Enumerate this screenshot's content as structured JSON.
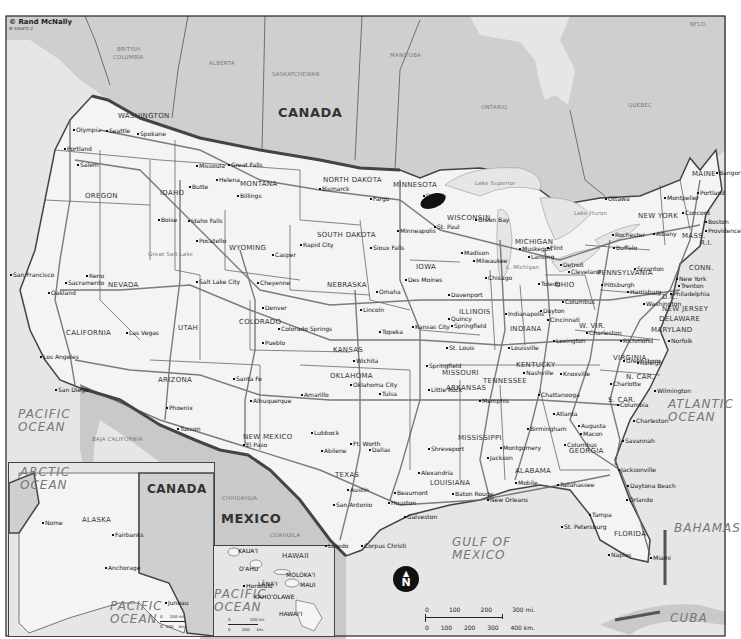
{
  "credit": {
    "publisher": "© Rand McNally",
    "code": "M-100672-2"
  },
  "countries": [
    {
      "name": "CANADA",
      "x": 278,
      "y": 106
    },
    {
      "name": "MEXICO",
      "x": 221,
      "y": 512
    },
    {
      "name": "CANADA",
      "x": 147,
      "y": 483,
      "inset": true
    }
  ],
  "provinces": [
    {
      "name": "BRITISH",
      "x": 117,
      "y": 47
    },
    {
      "name": "COLUMBIA",
      "x": 113,
      "y": 55
    },
    {
      "name": "ALBERTA",
      "x": 209,
      "y": 61
    },
    {
      "name": "SASKATCHEWAN",
      "x": 272,
      "y": 72
    },
    {
      "name": "MANITOBA",
      "x": 390,
      "y": 53
    },
    {
      "name": "ONTARIO",
      "x": 481,
      "y": 105
    },
    {
      "name": "QUÉBEC",
      "x": 628,
      "y": 103
    },
    {
      "name": "NFLD.",
      "x": 690,
      "y": 22
    },
    {
      "name": "CHIHUAHUA",
      "x": 222,
      "y": 496
    },
    {
      "name": "COAHUILA",
      "x": 270,
      "y": 533
    },
    {
      "name": "BAJA CALIFORNIA",
      "x": 92,
      "y": 437
    }
  ],
  "oceans": [
    {
      "name": "PACIFIC\nOCEAN",
      "x": 18,
      "y": 408
    },
    {
      "name": "ATLANTIC\nOCEAN",
      "x": 668,
      "y": 398
    },
    {
      "name": "GULF OF\nMEXICO",
      "x": 452,
      "y": 536
    },
    {
      "name": "BAHAMAS",
      "x": 674,
      "y": 522
    },
    {
      "name": "CUBA",
      "x": 670,
      "y": 612
    },
    {
      "name": "ARCTIC\nOCEAN",
      "x": 20,
      "y": 466
    },
    {
      "name": "PACIFIC\nOCEAN",
      "x": 110,
      "y": 600
    },
    {
      "name": "PACIFIC\nOCEAN",
      "x": 214,
      "y": 588
    }
  ],
  "states": [
    {
      "name": "WASHINGTON",
      "x": 118,
      "y": 113
    },
    {
      "name": "OREGON",
      "x": 85,
      "y": 193
    },
    {
      "name": "CALIFORNIA",
      "x": 66,
      "y": 330
    },
    {
      "name": "NEVADA",
      "x": 108,
      "y": 282
    },
    {
      "name": "IDAHO",
      "x": 160,
      "y": 190
    },
    {
      "name": "MONTANA",
      "x": 240,
      "y": 181
    },
    {
      "name": "WYOMING",
      "x": 229,
      "y": 245
    },
    {
      "name": "UTAH",
      "x": 178,
      "y": 325
    },
    {
      "name": "ARIZONA",
      "x": 158,
      "y": 377
    },
    {
      "name": "COLORADO",
      "x": 239,
      "y": 319
    },
    {
      "name": "NEW MEXICO",
      "x": 243,
      "y": 434
    },
    {
      "name": "NORTH DAKOTA",
      "x": 323,
      "y": 177
    },
    {
      "name": "SOUTH DAKOTA",
      "x": 317,
      "y": 232
    },
    {
      "name": "NEBRASKA",
      "x": 327,
      "y": 282
    },
    {
      "name": "KANSAS",
      "x": 333,
      "y": 347
    },
    {
      "name": "OKLAHOMA",
      "x": 330,
      "y": 373
    },
    {
      "name": "TEXAS",
      "x": 335,
      "y": 472
    },
    {
      "name": "MINNESOTA",
      "x": 393,
      "y": 182
    },
    {
      "name": "IOWA",
      "x": 416,
      "y": 264
    },
    {
      "name": "MISSOURI",
      "x": 442,
      "y": 370
    },
    {
      "name": "ARKANSAS",
      "x": 446,
      "y": 385
    },
    {
      "name": "LOUISIANA",
      "x": 430,
      "y": 480
    },
    {
      "name": "WISCONSIN",
      "x": 447,
      "y": 215
    },
    {
      "name": "ILLINOIS",
      "x": 459,
      "y": 309
    },
    {
      "name": "MICHIGAN",
      "x": 515,
      "y": 239
    },
    {
      "name": "INDIANA",
      "x": 510,
      "y": 326
    },
    {
      "name": "OHIO",
      "x": 555,
      "y": 282
    },
    {
      "name": "KENTUCKY",
      "x": 516,
      "y": 362
    },
    {
      "name": "TENNESSEE",
      "x": 483,
      "y": 378
    },
    {
      "name": "MISSISSIPPI",
      "x": 458,
      "y": 435
    },
    {
      "name": "ALABAMA",
      "x": 515,
      "y": 468
    },
    {
      "name": "GEORGIA",
      "x": 569,
      "y": 448
    },
    {
      "name": "FLORIDA",
      "x": 614,
      "y": 531
    },
    {
      "name": "S. CAR.",
      "x": 608,
      "y": 397
    },
    {
      "name": "N. CAR.",
      "x": 626,
      "y": 374
    },
    {
      "name": "VIRGINIA",
      "x": 613,
      "y": 355
    },
    {
      "name": "W. VIR.",
      "x": 579,
      "y": 323
    },
    {
      "name": "PENNSYLVANIA",
      "x": 597,
      "y": 270
    },
    {
      "name": "NEW YORK",
      "x": 638,
      "y": 213
    },
    {
      "name": "NEW JERSEY",
      "x": 662,
      "y": 306
    },
    {
      "name": "DELAWARE",
      "x": 659,
      "y": 316
    },
    {
      "name": "MARYLAND",
      "x": 651,
      "y": 327
    },
    {
      "name": "D.C.",
      "x": 662,
      "y": 294
    },
    {
      "name": "CONN.",
      "x": 689,
      "y": 265
    },
    {
      "name": "MASS.",
      "x": 682,
      "y": 233
    },
    {
      "name": "R.I.",
      "x": 700,
      "y": 240
    },
    {
      "name": "MAINE",
      "x": 692,
      "y": 171
    },
    {
      "name": "ALASKA",
      "x": 82,
      "y": 517
    },
    {
      "name": "HAWAII",
      "x": 282,
      "y": 553
    }
  ],
  "cities": [
    {
      "name": "Olympia",
      "x": 73,
      "y": 127
    },
    {
      "name": "Seattle",
      "x": 106,
      "y": 128
    },
    {
      "name": "Spokane",
      "x": 137,
      "y": 131
    },
    {
      "name": "Portland",
      "x": 64,
      "y": 146
    },
    {
      "name": "Salem",
      "x": 77,
      "y": 162
    },
    {
      "name": "Missoula",
      "x": 196,
      "y": 163
    },
    {
      "name": "Great Falls",
      "x": 228,
      "y": 162
    },
    {
      "name": "Helena",
      "x": 216,
      "y": 177
    },
    {
      "name": "Butte",
      "x": 189,
      "y": 184
    },
    {
      "name": "Billings",
      "x": 237,
      "y": 193
    },
    {
      "name": "Boise",
      "x": 158,
      "y": 217
    },
    {
      "name": "Idaho Falls",
      "x": 188,
      "y": 218
    },
    {
      "name": "Pocatello",
      "x": 196,
      "y": 238
    },
    {
      "name": "Bismarck",
      "x": 319,
      "y": 186
    },
    {
      "name": "Fargo",
      "x": 370,
      "y": 196
    },
    {
      "name": "Duluth",
      "x": 423,
      "y": 193
    },
    {
      "name": "Minneapolis",
      "x": 397,
      "y": 228
    },
    {
      "name": "St. Paul",
      "x": 434,
      "y": 224
    },
    {
      "name": "Rapid City",
      "x": 300,
      "y": 242
    },
    {
      "name": "Sioux Falls",
      "x": 370,
      "y": 245
    },
    {
      "name": "Casper",
      "x": 272,
      "y": 252
    },
    {
      "name": "Cheyenne",
      "x": 257,
      "y": 280
    },
    {
      "name": "San Francisco",
      "x": 10,
      "y": 272
    },
    {
      "name": "Oakland",
      "x": 48,
      "y": 290
    },
    {
      "name": "Sacramento",
      "x": 65,
      "y": 280
    },
    {
      "name": "Reno",
      "x": 86,
      "y": 273
    },
    {
      "name": "Salt Lake City",
      "x": 196,
      "y": 279
    },
    {
      "name": "Las Vegas",
      "x": 126,
      "y": 330
    },
    {
      "name": "Los Angeles",
      "x": 40,
      "y": 354
    },
    {
      "name": "San Diego",
      "x": 55,
      "y": 387
    },
    {
      "name": "Phoenix",
      "x": 166,
      "y": 405
    },
    {
      "name": "Tucson",
      "x": 177,
      "y": 426
    },
    {
      "name": "Denver",
      "x": 262,
      "y": 305
    },
    {
      "name": "Colorado Springs",
      "x": 278,
      "y": 326
    },
    {
      "name": "Pueblo",
      "x": 262,
      "y": 340
    },
    {
      "name": "Omaha",
      "x": 376,
      "y": 289
    },
    {
      "name": "Lincoln",
      "x": 360,
      "y": 307
    },
    {
      "name": "Des Moines",
      "x": 405,
      "y": 277
    },
    {
      "name": "Davenport",
      "x": 448,
      "y": 292
    },
    {
      "name": "Topeka",
      "x": 379,
      "y": 329
    },
    {
      "name": "Kansas City",
      "x": 412,
      "y": 324
    },
    {
      "name": "Wichita",
      "x": 353,
      "y": 358
    },
    {
      "name": "Quincy",
      "x": 448,
      "y": 316
    },
    {
      "name": "Springfield",
      "x": 451,
      "y": 323
    },
    {
      "name": "St. Louis",
      "x": 446,
      "y": 345
    },
    {
      "name": "Springfield",
      "x": 426,
      "y": 363
    },
    {
      "name": "Green Bay",
      "x": 475,
      "y": 217
    },
    {
      "name": "Madison",
      "x": 461,
      "y": 250
    },
    {
      "name": "Milwaukee",
      "x": 473,
      "y": 258
    },
    {
      "name": "Chicago",
      "x": 485,
      "y": 275
    },
    {
      "name": "Muskegon",
      "x": 519,
      "y": 246
    },
    {
      "name": "Lansing",
      "x": 528,
      "y": 254
    },
    {
      "name": "Flint",
      "x": 547,
      "y": 245
    },
    {
      "name": "Detroit",
      "x": 560,
      "y": 262
    },
    {
      "name": "Cleveland",
      "x": 568,
      "y": 269
    },
    {
      "name": "Toledo",
      "x": 538,
      "y": 281
    },
    {
      "name": "Columbus",
      "x": 562,
      "y": 299
    },
    {
      "name": "Dayton",
      "x": 540,
      "y": 308
    },
    {
      "name": "Cincinnati",
      "x": 547,
      "y": 317
    },
    {
      "name": "Indianapolis",
      "x": 505,
      "y": 311
    },
    {
      "name": "Louisville",
      "x": 508,
      "y": 345
    },
    {
      "name": "Lexington",
      "x": 553,
      "y": 338
    },
    {
      "name": "Charleston",
      "x": 586,
      "y": 330
    },
    {
      "name": "Pittsburgh",
      "x": 601,
      "y": 282
    },
    {
      "name": "Harrisburg",
      "x": 627,
      "y": 289
    },
    {
      "name": "Scranton",
      "x": 634,
      "y": 266
    },
    {
      "name": "Buffalo",
      "x": 613,
      "y": 245
    },
    {
      "name": "Rochester",
      "x": 612,
      "y": 232
    },
    {
      "name": "Albany",
      "x": 653,
      "y": 231
    },
    {
      "name": "Ottawa",
      "x": 605,
      "y": 196
    },
    {
      "name": "Montpelier",
      "x": 664,
      "y": 195
    },
    {
      "name": "Concord",
      "x": 682,
      "y": 210
    },
    {
      "name": "Portland",
      "x": 697,
      "y": 190
    },
    {
      "name": "Bangor",
      "x": 716,
      "y": 170
    },
    {
      "name": "Boston",
      "x": 705,
      "y": 219
    },
    {
      "name": "Providence",
      "x": 705,
      "y": 228
    },
    {
      "name": "New York",
      "x": 676,
      "y": 276
    },
    {
      "name": "Trenton",
      "x": 678,
      "y": 283
    },
    {
      "name": "Philadelphia",
      "x": 670,
      "y": 291
    },
    {
      "name": "Washington",
      "x": 643,
      "y": 301
    },
    {
      "name": "Richmond",
      "x": 620,
      "y": 338
    },
    {
      "name": "Norfolk",
      "x": 668,
      "y": 338
    },
    {
      "name": "Greensboro",
      "x": 623,
      "y": 358
    },
    {
      "name": "Raleigh",
      "x": 637,
      "y": 360
    },
    {
      "name": "Charlotte",
      "x": 610,
      "y": 381
    },
    {
      "name": "Wilmington",
      "x": 654,
      "y": 388
    },
    {
      "name": "Columbia",
      "x": 617,
      "y": 402
    },
    {
      "name": "Charleston",
      "x": 633,
      "y": 418
    },
    {
      "name": "Savannah",
      "x": 622,
      "y": 438
    },
    {
      "name": "Augusta",
      "x": 578,
      "y": 423
    },
    {
      "name": "Macon",
      "x": 580,
      "y": 431
    },
    {
      "name": "Columbus",
      "x": 564,
      "y": 442
    },
    {
      "name": "Atlanta",
      "x": 553,
      "y": 411
    },
    {
      "name": "Chattanooga",
      "x": 538,
      "y": 392
    },
    {
      "name": "Knoxville",
      "x": 560,
      "y": 371
    },
    {
      "name": "Nashville",
      "x": 523,
      "y": 370
    },
    {
      "name": "Memphis",
      "x": 479,
      "y": 398
    },
    {
      "name": "Birmingham",
      "x": 527,
      "y": 426
    },
    {
      "name": "Montgomery",
      "x": 500,
      "y": 445
    },
    {
      "name": "Jackson",
      "x": 487,
      "y": 455
    },
    {
      "name": "Mobile",
      "x": 515,
      "y": 480
    },
    {
      "name": "Tallahassee",
      "x": 557,
      "y": 482
    },
    {
      "name": "Jacksonville",
      "x": 618,
      "y": 467
    },
    {
      "name": "Daytona Beach",
      "x": 627,
      "y": 483
    },
    {
      "name": "Orlando",
      "x": 626,
      "y": 497
    },
    {
      "name": "Tampa",
      "x": 589,
      "y": 512
    },
    {
      "name": "St. Petersburg",
      "x": 561,
      "y": 524
    },
    {
      "name": "Naples",
      "x": 608,
      "y": 552
    },
    {
      "name": "Miami",
      "x": 650,
      "y": 555
    },
    {
      "name": "Little Rock",
      "x": 428,
      "y": 387
    },
    {
      "name": "Shreveport",
      "x": 428,
      "y": 446
    },
    {
      "name": "Alexandria",
      "x": 418,
      "y": 470
    },
    {
      "name": "Baton Rouge",
      "x": 452,
      "y": 491
    },
    {
      "name": "New Orleans",
      "x": 487,
      "y": 497
    },
    {
      "name": "Santa Fe",
      "x": 233,
      "y": 376
    },
    {
      "name": "Albuquerque",
      "x": 250,
      "y": 398
    },
    {
      "name": "El Paso",
      "x": 243,
      "y": 442
    },
    {
      "name": "Amarillo",
      "x": 301,
      "y": 392
    },
    {
      "name": "Lubbock",
      "x": 311,
      "y": 430
    },
    {
      "name": "Abilene",
      "x": 321,
      "y": 448
    },
    {
      "name": "Oklahoma City",
      "x": 350,
      "y": 382
    },
    {
      "name": "Tulsa",
      "x": 379,
      "y": 391
    },
    {
      "name": "Ft. Worth",
      "x": 350,
      "y": 441
    },
    {
      "name": "Dallas",
      "x": 369,
      "y": 447
    },
    {
      "name": "Austin",
      "x": 347,
      "y": 487
    },
    {
      "name": "San Antonio",
      "x": 333,
      "y": 502
    },
    {
      "name": "Houston",
      "x": 388,
      "y": 500
    },
    {
      "name": "Beaumont",
      "x": 394,
      "y": 490
    },
    {
      "name": "Galveston",
      "x": 404,
      "y": 514
    },
    {
      "name": "Laredo",
      "x": 325,
      "y": 543
    },
    {
      "name": "Corpus Christi",
      "x": 361,
      "y": 543
    },
    {
      "name": "Nome",
      "x": 42,
      "y": 520
    },
    {
      "name": "Fairbanks",
      "x": 112,
      "y": 532
    },
    {
      "name": "Anchorage",
      "x": 105,
      "y": 565
    },
    {
      "name": "Juneau",
      "x": 165,
      "y": 600
    },
    {
      "name": "Honolulu",
      "x": 243,
      "y": 583
    }
  ],
  "hawaii_islands": [
    {
      "name": "KAUA'I",
      "x": 238,
      "y": 548
    },
    {
      "name": "O'AHU",
      "x": 239,
      "y": 566
    },
    {
      "name": "MOLOKA'I",
      "x": 286,
      "y": 572
    },
    {
      "name": "LĀNA'I",
      "x": 258,
      "y": 581
    },
    {
      "name": "MAUI",
      "x": 300,
      "y": 582
    },
    {
      "name": "KAHO'OLAWE",
      "x": 254,
      "y": 594
    },
    {
      "name": "HAWAI'I",
      "x": 279,
      "y": 611
    }
  ],
  "lakes": [
    {
      "name": "Lake Superior",
      "x": 475,
      "y": 181
    },
    {
      "name": "L. Michigan",
      "x": 506,
      "y": 265
    },
    {
      "name": "Lake Huron",
      "x": 574,
      "y": 211
    },
    {
      "name": "Great Salt Lake",
      "x": 148,
      "y": 252
    }
  ],
  "scale_bar": {
    "miles": [
      "0",
      "100",
      "200",
      "300 mi."
    ],
    "km": [
      "0",
      "100",
      "200",
      "300",
      "400 km."
    ]
  },
  "alaska_scale": {
    "miles": [
      "0",
      "100 mi."
    ],
    "km": [
      "0",
      "100",
      "km."
    ]
  },
  "hawaii_scale": {
    "miles": [
      "0",
      "100 mi."
    ],
    "km": [
      "0",
      "100",
      "km."
    ]
  },
  "north_arrow": {
    "label": "N"
  },
  "colors": {
    "canada_fill": "#cfcfcf",
    "us_fill": "#f4f4f4",
    "mexico_fill": "#c9c9c9",
    "water": "#e6e6e6",
    "border": "#444444",
    "highway": "#666666"
  }
}
